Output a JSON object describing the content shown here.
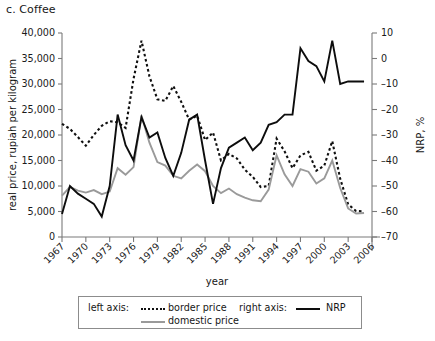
{
  "panel": {
    "label": "c. Coffee"
  },
  "legend": {
    "left_axis_label": "left axis:",
    "right_axis_label": "right axis:",
    "entries": [
      {
        "name": "border price",
        "style": "dotted",
        "color": "#101010",
        "axis": "left"
      },
      {
        "name": "domestic price",
        "style": "solid",
        "color": "#9a9a9a",
        "axis": "left"
      },
      {
        "name": "NRP",
        "style": "solid",
        "color": "#0d0d0d",
        "axis": "right"
      }
    ]
  },
  "chart_data": {
    "type": "line",
    "title": "c. Coffee",
    "xlabel": "year",
    "ylabel": "real price, rupiah per kilogram",
    "y2label": "NRP, %",
    "xlim": [
      1967,
      2006
    ],
    "ylim": [
      0,
      40000
    ],
    "y2lim": [
      -70,
      10
    ],
    "grid": false,
    "legend_position": "bottom",
    "xticks": [
      1967,
      1970,
      1973,
      1976,
      1979,
      1982,
      1985,
      1988,
      1991,
      1994,
      1997,
      2000,
      2003,
      2006
    ],
    "xticklabels": [
      "1967",
      "1970",
      "1973",
      "1976",
      "1979",
      "1982",
      "1985",
      "1988",
      "1991",
      "1994",
      "1997",
      "2000",
      "2003",
      "2006"
    ],
    "yticks": [
      0,
      5000,
      10000,
      15000,
      20000,
      25000,
      30000,
      35000,
      40000
    ],
    "yticklabels": [
      "0",
      "5,000",
      "10,000",
      "15,000",
      "20,000",
      "25,000",
      "30,000",
      "35,000",
      "40,000"
    ],
    "y2ticks": [
      -70,
      -60,
      -50,
      -40,
      -30,
      -20,
      -10,
      0,
      10
    ],
    "y2ticklabels": [
      "–70",
      "–60",
      "–50",
      "–40",
      "–30",
      "–20",
      "–10",
      "0",
      "10"
    ],
    "x": [
      1967,
      1968,
      1969,
      1970,
      1971,
      1972,
      1973,
      1974,
      1975,
      1976,
      1977,
      1978,
      1979,
      1980,
      1981,
      1982,
      1983,
      1984,
      1985,
      1986,
      1987,
      1988,
      1989,
      1990,
      1991,
      1992,
      1993,
      1994,
      1995,
      1996,
      1997,
      1998,
      1999,
      2000,
      2001,
      2002,
      2003,
      2004,
      2005
    ],
    "series": [
      {
        "name": "border price",
        "axis": "left",
        "style": "dotted",
        "color": "#101010",
        "values": [
          22200,
          21200,
          19600,
          17900,
          20000,
          21800,
          22700,
          22500,
          21400,
          31000,
          38500,
          31500,
          27000,
          26700,
          29600,
          26500,
          23000,
          23800,
          19000,
          20500,
          15000,
          16300,
          15400,
          13200,
          11800,
          9800,
          10000,
          19300,
          16800,
          13500,
          16000,
          16700,
          13000,
          14000,
          18800,
          11400,
          6400,
          5100,
          5000
        ]
      },
      {
        "name": "domestic price",
        "axis": "left",
        "style": "solid",
        "color": "#9a9a9a",
        "values": [
          8100,
          9800,
          9100,
          8700,
          9200,
          8400,
          8900,
          13500,
          12200,
          13700,
          23800,
          18500,
          14700,
          14000,
          12000,
          11500,
          13000,
          14200,
          12900,
          10000,
          8600,
          9500,
          8400,
          7700,
          7200,
          7000,
          9300,
          16000,
          12300,
          10000,
          13300,
          12800,
          10500,
          11500,
          15000,
          9600,
          5600,
          4600,
          4700
        ]
      },
      {
        "name": "NRP",
        "axis": "right",
        "style": "solid",
        "color": "#0d0d0d",
        "values": [
          -61,
          -50,
          -53,
          -55,
          -57,
          -62,
          -50,
          -22,
          -34,
          -40,
          -23,
          -31,
          -29,
          -39,
          -46,
          -37,
          -24,
          -22,
          -40,
          -57,
          -43,
          -35,
          -33,
          -31,
          -36,
          -33,
          -26,
          -25,
          -22,
          -22,
          4,
          -1,
          -3,
          -9,
          7,
          -10,
          -9,
          -9,
          -9
        ]
      }
    ]
  }
}
